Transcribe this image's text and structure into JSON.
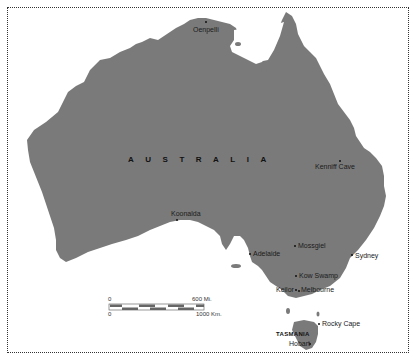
{
  "map": {
    "country_label": "AUSTRALIA",
    "state_label": "TASMANIA",
    "land_color": "#7a7a7a",
    "water_color": "#ffffff",
    "sites": [
      {
        "name": "Oenpelli",
        "x": 205,
        "y": 22
      },
      {
        "name": "Kenniff Cave",
        "x": 340,
        "y": 162
      },
      {
        "name": "Koonalda",
        "x": 177,
        "y": 220
      },
      {
        "name": "Mossgiel",
        "x": 294,
        "y": 246
      },
      {
        "name": "Adelaide",
        "x": 249,
        "y": 254
      },
      {
        "name": "Sydney",
        "x": 351,
        "y": 255
      },
      {
        "name": "Kow Swamp",
        "x": 294,
        "y": 276
      },
      {
        "name": "Keilor",
        "x": 293,
        "y": 291
      },
      {
        "name": "Melbourne",
        "x": 298,
        "y": 290
      },
      {
        "name": "Rocky Cape",
        "x": 319,
        "y": 323
      },
      {
        "name": "Hobart",
        "x": 310,
        "y": 343
      }
    ],
    "scale": {
      "miles_zero": "0",
      "miles_max": "600 Mi.",
      "km_zero": "0",
      "km_max": "1000 Km."
    }
  }
}
